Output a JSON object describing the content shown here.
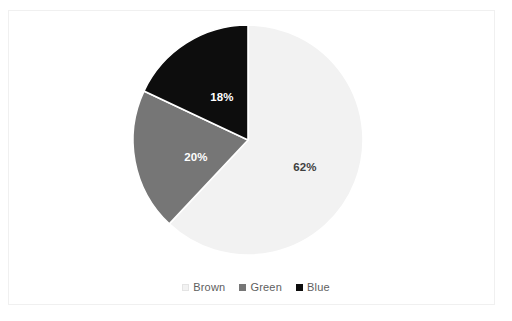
{
  "chart_data": {
    "type": "pie",
    "title": "",
    "categories": [
      "Brown",
      "Green",
      "Blue"
    ],
    "values": [
      62,
      20,
      18
    ],
    "value_labels": [
      "62%",
      "20%",
      "18%"
    ],
    "colors": [
      "#f2f2f2",
      "#767676",
      "#0d0d0d"
    ],
    "label_colors": [
      "#3f3f3f",
      "#ffffff",
      "#ffffff"
    ],
    "units": "percent",
    "start_angle_deg": 0,
    "direction": "clockwise",
    "legend": {
      "position": "bottom",
      "entries": [
        {
          "label": "Brown",
          "color": "#f2f2f2",
          "marker": "square"
        },
        {
          "label": "Green",
          "color": "#767676",
          "marker": "square"
        },
        {
          "label": "Blue",
          "color": "#0d0d0d",
          "marker": "square"
        }
      ]
    },
    "grid": false,
    "xlabel": "",
    "ylabel": ""
  },
  "frame": {
    "border_color": "#f0f0f0",
    "background": "#ffffff"
  }
}
